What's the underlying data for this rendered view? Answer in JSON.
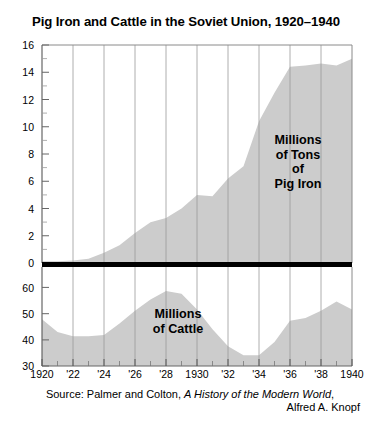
{
  "chart_data": {
    "type": "area",
    "title": "Pig Iron and Cattle in the Soviet Union, 1920–1940",
    "xlabel": "",
    "grid": true,
    "legend": false,
    "panels": [
      {
        "name": "pig-iron",
        "label": "Millions\nof Tons\nof\nPig Iron",
        "label_lines": [
          "Millions",
          "of Tons",
          "of",
          "Pig Iron"
        ],
        "ylabel": "Millions of Tons of Pig Iron",
        "ylim": [
          0,
          16
        ],
        "yticks": [
          0,
          2,
          4,
          6,
          8,
          10,
          12,
          14,
          16
        ],
        "ytick_labels": [
          "0",
          "2",
          "4",
          "6",
          "8",
          "10",
          "12",
          "14",
          "16"
        ],
        "fill_color": "#cccccc",
        "x": [
          1920,
          1921,
          1922,
          1923,
          1924,
          1925,
          1926,
          1927,
          1928,
          1929,
          1930,
          1931,
          1932,
          1933,
          1934,
          1935,
          1936,
          1937,
          1938,
          1939,
          1940
        ],
        "values": [
          0.12,
          0.12,
          0.19,
          0.31,
          0.75,
          1.3,
          2.2,
          3.0,
          3.3,
          4.0,
          5.0,
          4.9,
          6.2,
          7.1,
          10.4,
          12.5,
          14.4,
          14.5,
          14.65,
          14.5,
          15.0
        ]
      },
      {
        "name": "cattle",
        "label": "Millions\nof Cattle",
        "label_lines": [
          "Millions",
          "of Cattle"
        ],
        "ylabel": "Millions of Cattle",
        "ylim": [
          30,
          65
        ],
        "yticks": [
          40,
          50,
          60
        ],
        "ytick_labels": [
          "30",
          "40",
          "50",
          "60"
        ],
        "fill_color": "#cccccc",
        "x": [
          1920,
          1921,
          1922,
          1923,
          1924,
          1925,
          1926,
          1927,
          1928,
          1929,
          1930,
          1931,
          1932,
          1933,
          1934,
          1935,
          1936,
          1937,
          1938,
          1939,
          1940
        ],
        "values": [
          46.5,
          42.0,
          40.5,
          40.5,
          41.0,
          45.0,
          49.5,
          53.5,
          56.5,
          55.5,
          50.0,
          43.0,
          37.0,
          33.8,
          33.8,
          38.5,
          46.0,
          47.0,
          49.5,
          52.8,
          50.0
        ]
      }
    ],
    "xticks": [
      1920,
      1922,
      1924,
      1926,
      1928,
      1930,
      1932,
      1934,
      1936,
      1938,
      1940
    ],
    "xtick_labels": [
      "1920",
      "'22",
      "'24",
      "'26",
      "'28",
      "1930",
      "'32",
      "'34",
      "'36",
      "'38",
      "1940"
    ],
    "xlim": [
      1920,
      1940
    ],
    "source_line1_prefix": "Source: Palmer and Colton, ",
    "source_line1_italic": "A History of the Modern World",
    "source_line1_suffix": ",",
    "source_line2": "Alfred A. Knopf",
    "colors": {
      "area_fill": "#cccccc",
      "gridline": "#9a9a9a",
      "axis": "#666666",
      "divider": "#000000",
      "text": "#000000"
    }
  }
}
